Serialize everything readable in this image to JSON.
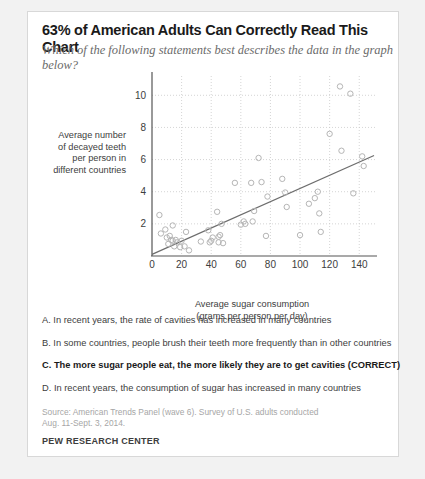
{
  "card": {
    "title": "63% of American Adults Can Correctly Read This Chart",
    "subtitle": "Which of the following statements best describes the data in the graph below?"
  },
  "options": [
    {
      "id": "A",
      "text": "A. In recent years, the rate of cavities has increased in many countries",
      "correct": false
    },
    {
      "id": "B",
      "text": "B. In some countries, people brush their teeth more frequently than in other countries",
      "correct": false
    },
    {
      "id": "C",
      "text": "C. The more sugar people eat, the more likely they are to get cavities (CORRECT)",
      "correct": true
    },
    {
      "id": "D",
      "text": "D. In recent years, the consumption of sugar has increased in many countries",
      "correct": false
    }
  ],
  "footer": {
    "source_line1": "Source: American Trends Panel (wave 6). Survey of U.S. adults conducted",
    "source_line2": "Aug. 11-Sept. 3, 2014.",
    "brand": "PEW RESEARCH CENTER"
  },
  "axis_label_text": {
    "y_line1": "Average number",
    "y_line2": "of decayed teeth",
    "y_line3": "per person in",
    "y_line4": "different countries",
    "x_line1": "Average sugar consumption",
    "x_line2": "(grams per person per day)"
  },
  "colors": {
    "marker_stroke": "#b5b5b5",
    "trend_line": "#6d6d6d",
    "grid": "#c9c9c9",
    "axis": "#555555",
    "tick_text": "#3d3d3d",
    "muted_text": "#a6a6a6",
    "card_bg": "#ffffff",
    "page_bg": "#f2f2f2"
  },
  "chart_data": {
    "type": "scatter",
    "title": "",
    "xlabel": "Average sugar consumption (grams per person per day)",
    "ylabel": "Average number of decayed teeth per person in different countries",
    "xlim": [
      0,
      152
    ],
    "ylim": [
      0,
      11.2
    ],
    "xticks": [
      0,
      20,
      40,
      60,
      80,
      100,
      120,
      140
    ],
    "yticks": [
      2,
      4,
      6,
      8,
      10
    ],
    "grid": true,
    "grid_style": "dotted",
    "legend": null,
    "marker": "open-circle",
    "trend_line": {
      "x": [
        0,
        150
      ],
      "y": [
        0.1,
        6.25
      ],
      "style": "solid"
    },
    "points": [
      [
        5,
        2.55
      ],
      [
        6,
        1.4
      ],
      [
        9,
        1.65
      ],
      [
        10,
        1.15
      ],
      [
        11,
        0.75
      ],
      [
        12,
        1.25
      ],
      [
        13,
        1.0
      ],
      [
        14,
        1.9
      ],
      [
        14,
        0.95
      ],
      [
        15,
        0.6
      ],
      [
        16,
        1.0
      ],
      [
        17,
        0.85
      ],
      [
        19,
        0.55
      ],
      [
        20,
        0.95
      ],
      [
        22,
        0.6
      ],
      [
        23,
        1.5
      ],
      [
        25,
        0.35
      ],
      [
        33,
        0.9
      ],
      [
        38,
        1.6
      ],
      [
        39,
        0.85
      ],
      [
        40,
        0.95
      ],
      [
        41,
        1.15
      ],
      [
        44,
        2.75
      ],
      [
        45,
        1.2
      ],
      [
        45,
        0.85
      ],
      [
        46,
        1.3
      ],
      [
        47,
        2.0
      ],
      [
        48,
        0.8
      ],
      [
        56,
        4.55
      ],
      [
        60,
        1.95
      ],
      [
        62,
        2.15
      ],
      [
        63,
        2.0
      ],
      [
        67,
        4.55
      ],
      [
        68,
        2.15
      ],
      [
        69,
        2.8
      ],
      [
        72,
        6.1
      ],
      [
        74,
        4.6
      ],
      [
        77,
        1.25
      ],
      [
        78,
        3.7
      ],
      [
        88,
        4.8
      ],
      [
        90,
        3.95
      ],
      [
        91,
        3.05
      ],
      [
        100,
        1.3
      ],
      [
        106,
        3.25
      ],
      [
        110,
        3.6
      ],
      [
        112,
        4.0
      ],
      [
        113,
        2.65
      ],
      [
        114,
        1.5
      ],
      [
        120,
        7.6
      ],
      [
        127,
        10.55
      ],
      [
        128,
        6.55
      ],
      [
        134,
        10.1
      ],
      [
        136,
        3.9
      ],
      [
        142,
        6.2
      ],
      [
        143,
        5.6
      ]
    ]
  }
}
